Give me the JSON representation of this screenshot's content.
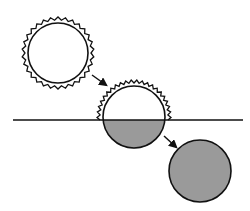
{
  "diagram": {
    "colors": {
      "stroke": "#111111",
      "fill_light": "#ffffff",
      "fill_shaded": "#9a9a9a",
      "background": "#ffffff"
    },
    "line": {
      "y": 120,
      "x1": 13,
      "x2": 243
    },
    "stages": [
      {
        "id": "stage-1",
        "shape": "circle-with-serrated-coat",
        "cx": 58,
        "cy": 53,
        "r": 30,
        "coat_r": 36,
        "shaded": "none"
      },
      {
        "id": "stage-2",
        "shape": "circle-with-serrated-coat-partial",
        "cx": 134,
        "cy": 117,
        "r": 31,
        "coat_r": 37,
        "shaded": "lower-half"
      },
      {
        "id": "stage-3",
        "shape": "plain-circle",
        "cx": 200,
        "cy": 171,
        "r": 31,
        "shaded": "full"
      }
    ],
    "arrows": [
      {
        "id": "arrow-1",
        "from": [
          92,
          75
        ],
        "to": [
          106,
          85
        ]
      },
      {
        "id": "arrow-2",
        "from": [
          164,
          136
        ],
        "to": [
          176,
          147
        ]
      }
    ]
  }
}
